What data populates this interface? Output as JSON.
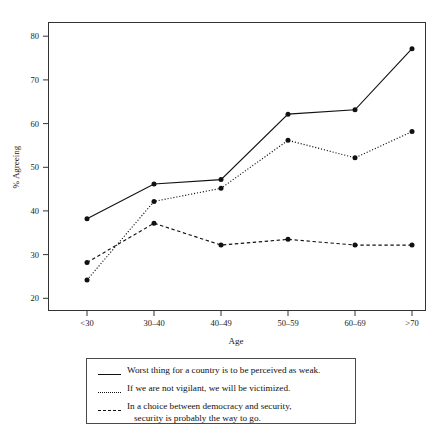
{
  "chart_data": {
    "type": "line",
    "title": "",
    "xlabel": "Age",
    "ylabel": "% Agreeing",
    "categories": [
      "<30",
      "30–40",
      "40–49",
      "50–59",
      "60–69",
      ">70"
    ],
    "ylim": [
      17,
      83
    ],
    "yticks": [
      20,
      30,
      40,
      50,
      60,
      70,
      80
    ],
    "ytick_labels": [
      "20",
      "30",
      "40",
      "50",
      "60",
      "70",
      "80"
    ],
    "grid": false,
    "legend_position": "below-plot",
    "series": [
      {
        "name": "Worst thing for a country is to be perceived as weak.",
        "style": "solid",
        "values": [
          38,
          46,
          47,
          62,
          63,
          77
        ]
      },
      {
        "name": "If we are not vigilant, we will be victimized.",
        "style": "dotted",
        "values": [
          24,
          42,
          45,
          56,
          52,
          58
        ]
      },
      {
        "name": "In a choice between democracy and security, security is probably the way to go.",
        "style": "dashed",
        "values": [
          28,
          37,
          32,
          33.3,
          32,
          32
        ]
      }
    ]
  },
  "axes": {
    "y_title": "% Agreeing",
    "x_title": "Age",
    "y_tick_0": "20",
    "y_tick_1": "30",
    "y_tick_2": "40",
    "y_tick_3": "50",
    "y_tick_4": "60",
    "y_tick_5": "70",
    "y_tick_6": "80",
    "x_tick_0": "<30",
    "x_tick_1": "30–40",
    "x_tick_2": "40–49",
    "x_tick_3": "50–59",
    "x_tick_4": "60–69",
    "x_tick_5": ">70"
  },
  "legend": {
    "entries": [
      {
        "style": "solid",
        "line1": "Worst thing for a country is to be perceived as weak.",
        "line2": ""
      },
      {
        "style": "dotted",
        "line1": "If we are not vigilant, we will be victimized.",
        "line2": ""
      },
      {
        "style": "dashed",
        "line1": "In a choice between democracy and security,",
        "line2": "security is probably the way to go."
      }
    ]
  },
  "colors": {
    "ink": "#111111",
    "frame": "#333333",
    "background": "#ffffff"
  }
}
